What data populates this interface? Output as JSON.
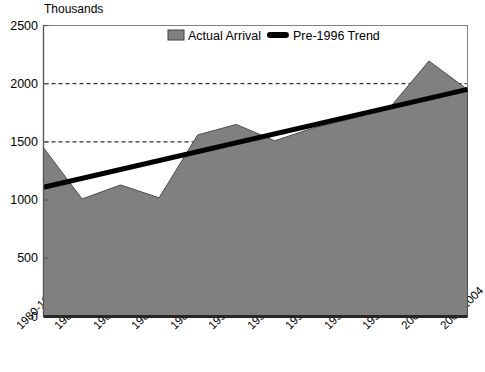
{
  "chart_data": {
    "type": "area",
    "title": "",
    "unit_label": "Thousands",
    "xlabel": "",
    "ylabel": "",
    "ylim": [
      0,
      2500
    ],
    "yticks": [
      0,
      500,
      1000,
      1500,
      2000,
      2500
    ],
    "gridlines": [
      1500,
      2000
    ],
    "grid": true,
    "legend_position": "top-center",
    "categories": [
      "1980-1981",
      "1982-1983",
      "1984-1985",
      "1986-1987",
      "1988-1989",
      "1990-1991",
      "1992-1993",
      "1994-1995",
      "1996-1997",
      "1998-1999",
      "2000-2001",
      "2002-2004"
    ],
    "series": [
      {
        "name": "Actual Arrival",
        "type": "area",
        "color": "#808080",
        "values": [
          1450,
          1010,
          1130,
          1020,
          1560,
          1650,
          1510,
          1620,
          1700,
          1800,
          2195,
          1950
        ]
      },
      {
        "name": "Pre-1996 Trend",
        "type": "line",
        "color": "#000000",
        "values": [
          1110,
          1186,
          1263,
          1339,
          1416,
          1492,
          1569,
          1645,
          1722,
          1798,
          1875,
          1951
        ]
      }
    ],
    "legend": [
      {
        "label": "Actual Arrival",
        "marker": "filled-square",
        "color": "#808080"
      },
      {
        "label": "Pre-1996 Trend",
        "marker": "thick-line",
        "color": "#000000"
      }
    ]
  }
}
